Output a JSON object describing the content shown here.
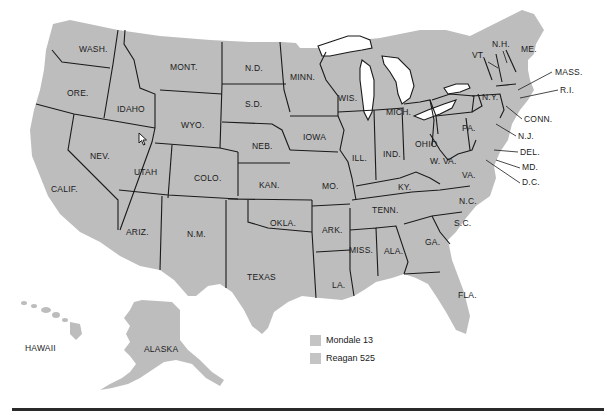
{
  "map": {
    "subject": "1984 U.S. presidential election electoral map",
    "fill_color": "#bdbdbd",
    "border_color": "#1a1a1a",
    "state_labels": [
      {
        "id": "wash",
        "text": "WASH.",
        "x": 79,
        "y": 52
      },
      {
        "id": "ore",
        "text": "ORE.",
        "x": 67,
        "y": 96
      },
      {
        "id": "calif",
        "text": "CALIF.",
        "x": 51,
        "y": 192
      },
      {
        "id": "nev",
        "text": "NEV.",
        "x": 90,
        "y": 159
      },
      {
        "id": "idaho",
        "text": "IDAHO",
        "x": 117,
        "y": 112
      },
      {
        "id": "mont",
        "text": "MONT.",
        "x": 170,
        "y": 70
      },
      {
        "id": "wyo",
        "text": "WYO.",
        "x": 181,
        "y": 128
      },
      {
        "id": "utah",
        "text": "UTAH",
        "x": 134,
        "y": 175
      },
      {
        "id": "colo",
        "text": "COLO.",
        "x": 194,
        "y": 181
      },
      {
        "id": "ariz",
        "text": "ARIZ.",
        "x": 126,
        "y": 235
      },
      {
        "id": "nm",
        "text": "N.M.",
        "x": 187,
        "y": 237
      },
      {
        "id": "nd",
        "text": "N.D.",
        "x": 245,
        "y": 71
      },
      {
        "id": "sd",
        "text": "S.D.",
        "x": 245,
        "y": 107
      },
      {
        "id": "neb",
        "text": "NEB.",
        "x": 252,
        "y": 149
      },
      {
        "id": "kan",
        "text": "KAN.",
        "x": 259,
        "y": 188
      },
      {
        "id": "okla",
        "text": "OKLA.",
        "x": 270,
        "y": 226
      },
      {
        "id": "texas",
        "text": "TEXAS",
        "x": 247,
        "y": 280
      },
      {
        "id": "minn",
        "text": "MINN.",
        "x": 290,
        "y": 80
      },
      {
        "id": "iowa",
        "text": "IOWA",
        "x": 303,
        "y": 140
      },
      {
        "id": "mo",
        "text": "MO.",
        "x": 322,
        "y": 189
      },
      {
        "id": "ark",
        "text": "ARK.",
        "x": 322,
        "y": 233
      },
      {
        "id": "la",
        "text": "LA.",
        "x": 332,
        "y": 288
      },
      {
        "id": "wis",
        "text": "WIS.",
        "x": 338,
        "y": 101
      },
      {
        "id": "ill",
        "text": "ILL.",
        "x": 352,
        "y": 161
      },
      {
        "id": "mich",
        "text": "MICH.",
        "x": 386,
        "y": 115
      },
      {
        "id": "ind",
        "text": "IND.",
        "x": 383,
        "y": 157
      },
      {
        "id": "ohio",
        "text": "OHIO",
        "x": 415,
        "y": 147
      },
      {
        "id": "ky",
        "text": "KY.",
        "x": 398,
        "y": 190
      },
      {
        "id": "tenn",
        "text": "TENN.",
        "x": 372,
        "y": 213
      },
      {
        "id": "miss",
        "text": "MISS.",
        "x": 349,
        "y": 253
      },
      {
        "id": "ala",
        "text": "ALA.",
        "x": 384,
        "y": 254
      },
      {
        "id": "ga",
        "text": "GA.",
        "x": 425,
        "y": 245
      },
      {
        "id": "fla",
        "text": "FLA.",
        "x": 458,
        "y": 298
      },
      {
        "id": "sc",
        "text": "S.C.",
        "x": 454,
        "y": 226
      },
      {
        "id": "nc",
        "text": "N.C.",
        "x": 459,
        "y": 204
      },
      {
        "id": "wva",
        "text": "W. VA.",
        "x": 430,
        "y": 164
      },
      {
        "id": "va",
        "text": "VA.",
        "x": 462,
        "y": 178
      },
      {
        "id": "pa",
        "text": "PA.",
        "x": 462,
        "y": 131
      },
      {
        "id": "ny",
        "text": "N.Y.",
        "x": 482,
        "y": 100
      },
      {
        "id": "vt",
        "text": "VT.",
        "x": 472,
        "y": 58
      },
      {
        "id": "nh",
        "text": "N.H.",
        "x": 492,
        "y": 47
      },
      {
        "id": "me",
        "text": "ME.",
        "x": 521,
        "y": 52
      },
      {
        "id": "mass",
        "text": "MASS.",
        "x": 555,
        "y": 75
      },
      {
        "id": "ri",
        "text": "R.I.",
        "x": 560,
        "y": 93
      },
      {
        "id": "conn",
        "text": "CONN.",
        "x": 524,
        "y": 122
      },
      {
        "id": "nj",
        "text": "N.J.",
        "x": 518,
        "y": 139
      },
      {
        "id": "del",
        "text": "DEL.",
        "x": 520,
        "y": 155
      },
      {
        "id": "md",
        "text": "MD.",
        "x": 522,
        "y": 170
      },
      {
        "id": "dc",
        "text": "D.C.",
        "x": 522,
        "y": 185
      },
      {
        "id": "hawaii",
        "text": "HAWAII",
        "x": 25,
        "y": 351
      },
      {
        "id": "alaska",
        "text": "ALASKA",
        "x": 144,
        "y": 352
      }
    ]
  },
  "legend": {
    "items": [
      {
        "label": "Mondale 13",
        "color": "#c4c4c4"
      },
      {
        "label": "Reagan 525",
        "color": "#c4c4c4"
      }
    ]
  }
}
